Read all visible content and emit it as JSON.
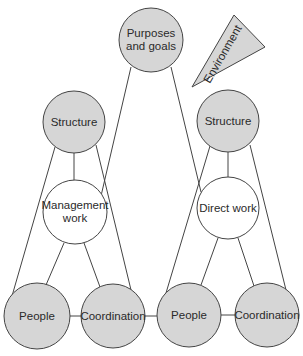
{
  "colors": {
    "node_fill_grey": "#d6d6d6",
    "node_fill_white": "#ffffff",
    "stroke": "#444444",
    "text": "#2a2a2a"
  },
  "nodes": {
    "purposes": {
      "line1": "Purposes",
      "line2": "and goals"
    },
    "environment": {
      "label": "Environment"
    },
    "structure_left": {
      "label": "Structure"
    },
    "management_work": {
      "line1": "Management",
      "line2": "work"
    },
    "people_left": {
      "label": "People"
    },
    "coordination_left": {
      "label": "Coordination"
    },
    "structure_right": {
      "label": "Structure"
    },
    "direct_work": {
      "label": "Direct work"
    },
    "people_right": {
      "label": "People"
    },
    "coordination_right": {
      "label": "Coordination"
    }
  }
}
